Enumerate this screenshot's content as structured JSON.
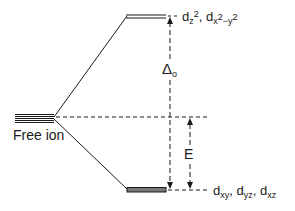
{
  "diagram": {
    "free_ion": {
      "label": "Free ion"
    },
    "upper_level": {
      "orbitals": [
        {
          "base": "d",
          "sub": "z",
          "sup": "2"
        },
        {
          "base": "d",
          "sub": "x",
          "sup": "2",
          "sub2": "−y",
          "sup2": "2"
        }
      ],
      "label_text": "dz2, dx2-y2"
    },
    "lower_level": {
      "orbitals": [
        {
          "base": "d",
          "sub": "xy"
        },
        {
          "base": "d",
          "sub": "yz"
        },
        {
          "base": "d",
          "sub": "xz"
        }
      ],
      "label_text": "dxy, dyz, dxz"
    },
    "splitting": {
      "symbol": "Δ",
      "subscript": "o"
    },
    "energy_gap": {
      "label": "E"
    },
    "separator": ", ",
    "colors": {
      "ink": "#1a1a1a",
      "background": "#ffffff"
    }
  }
}
